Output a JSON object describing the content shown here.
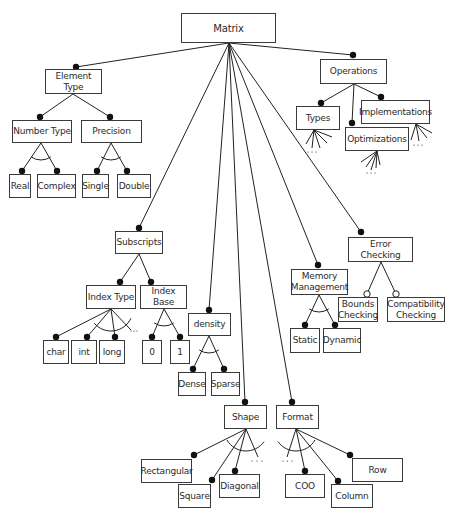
{
  "diagram": {
    "title": "Matrix",
    "colors": {
      "line": "#222222",
      "border": "#3a3a3a",
      "text": "#2b2b2b",
      "dot": "#111111",
      "background": "#ffffff"
    },
    "nodes": [
      {
        "id": "matrix",
        "label": "Matrix",
        "x": 181,
        "y": 13,
        "w": 95,
        "h": 30,
        "root": true
      },
      {
        "id": "element-type",
        "label": "Element Type",
        "x": 45,
        "y": 69,
        "w": 57,
        "h": 25
      },
      {
        "id": "number-type",
        "label": "Number Type",
        "x": 12,
        "y": 120,
        "w": 60,
        "h": 23
      },
      {
        "id": "precision",
        "label": "Precision",
        "x": 81,
        "y": 120,
        "w": 61,
        "h": 23
      },
      {
        "id": "real",
        "label": "Real",
        "x": 9,
        "y": 174,
        "w": 22,
        "h": 24
      },
      {
        "id": "complex",
        "label": "Complex",
        "x": 37,
        "y": 174,
        "w": 39,
        "h": 24
      },
      {
        "id": "single",
        "label": "Single",
        "x": 82,
        "y": 174,
        "w": 27,
        "h": 24
      },
      {
        "id": "double",
        "label": "Double",
        "x": 117,
        "y": 174,
        "w": 34,
        "h": 24
      },
      {
        "id": "operations",
        "label": "Operations",
        "x": 320,
        "y": 59,
        "w": 67,
        "h": 25
      },
      {
        "id": "types",
        "label": "Types",
        "x": 296,
        "y": 106,
        "w": 44,
        "h": 24
      },
      {
        "id": "implementations",
        "label": "Implementations",
        "x": 361,
        "y": 100,
        "w": 69,
        "h": 24
      },
      {
        "id": "optimizations",
        "label": "Optimizations",
        "x": 345,
        "y": 127,
        "w": 64,
        "h": 24
      },
      {
        "id": "subscripts",
        "label": "Subscripts",
        "x": 115,
        "y": 231,
        "w": 48,
        "h": 23
      },
      {
        "id": "index-type",
        "label": "Index Type",
        "x": 86,
        "y": 285,
        "w": 50,
        "h": 24
      },
      {
        "id": "index-base",
        "label": "Index Base",
        "x": 140,
        "y": 285,
        "w": 47,
        "h": 24
      },
      {
        "id": "char",
        "label": "char",
        "x": 43,
        "y": 340,
        "w": 26,
        "h": 24
      },
      {
        "id": "int",
        "label": "int",
        "x": 71,
        "y": 340,
        "w": 26,
        "h": 24
      },
      {
        "id": "long",
        "label": "long",
        "x": 99,
        "y": 340,
        "w": 26,
        "h": 24
      },
      {
        "id": "zero",
        "label": "0",
        "x": 142,
        "y": 340,
        "w": 20,
        "h": 24
      },
      {
        "id": "one",
        "label": "1",
        "x": 170,
        "y": 340,
        "w": 20,
        "h": 24
      },
      {
        "id": "density",
        "label": "density",
        "x": 188,
        "y": 313,
        "w": 43,
        "h": 23
      },
      {
        "id": "dense",
        "label": "Dense",
        "x": 178,
        "y": 372,
        "w": 28,
        "h": 24
      },
      {
        "id": "sparse",
        "label": "Sparse",
        "x": 211,
        "y": 372,
        "w": 29,
        "h": 24
      },
      {
        "id": "memory-management",
        "label": "Memory\nManagement",
        "x": 291,
        "y": 269,
        "w": 57,
        "h": 26
      },
      {
        "id": "static",
        "label": "Static",
        "x": 290,
        "y": 328,
        "w": 30,
        "h": 25
      },
      {
        "id": "dynamic",
        "label": "Dynamic",
        "x": 323,
        "y": 328,
        "w": 38,
        "h": 25
      },
      {
        "id": "error-checking",
        "label": "Error Checking",
        "x": 348,
        "y": 237,
        "w": 65,
        "h": 25
      },
      {
        "id": "bounds-checking",
        "label": "Bounds\nChecking",
        "x": 338,
        "y": 297,
        "w": 40,
        "h": 25
      },
      {
        "id": "compatibility-checking",
        "label": "Compatibility\nChecking",
        "x": 387,
        "y": 297,
        "w": 58,
        "h": 25
      },
      {
        "id": "shape",
        "label": "Shape",
        "x": 224,
        "y": 405,
        "w": 43,
        "h": 24
      },
      {
        "id": "rectangular",
        "label": "Rectangular",
        "x": 141,
        "y": 459,
        "w": 51,
        "h": 24
      },
      {
        "id": "square",
        "label": "Square",
        "x": 178,
        "y": 484,
        "w": 33,
        "h": 24
      },
      {
        "id": "diagonal",
        "label": "Diagonal",
        "x": 219,
        "y": 474,
        "w": 41,
        "h": 24
      },
      {
        "id": "format",
        "label": "Format",
        "x": 276,
        "y": 405,
        "w": 43,
        "h": 24
      },
      {
        "id": "coo",
        "label": "COO",
        "x": 285,
        "y": 474,
        "w": 40,
        "h": 24
      },
      {
        "id": "column",
        "label": "Column",
        "x": 331,
        "y": 484,
        "w": 42,
        "h": 24
      },
      {
        "id": "row",
        "label": "Row",
        "x": 352,
        "y": 458,
        "w": 51,
        "h": 24
      }
    ],
    "edges": [
      {
        "from": [
          229,
          43
        ],
        "to": [
          76,
          67
        ],
        "end": "filled"
      },
      {
        "from": [
          229,
          43
        ],
        "to": [
          353,
          55
        ],
        "end": "filled"
      },
      {
        "from": [
          229,
          43
        ],
        "to": [
          139,
          228
        ],
        "end": "filled"
      },
      {
        "from": [
          229,
          43
        ],
        "to": [
          209,
          310
        ],
        "end": "filled"
      },
      {
        "from": [
          229,
          43
        ],
        "to": [
          245,
          402
        ],
        "end": "filled"
      },
      {
        "from": [
          229,
          43
        ],
        "to": [
          292,
          402
        ],
        "end": "filled"
      },
      {
        "from": [
          229,
          43
        ],
        "to": [
          318,
          265
        ],
        "end": "filled"
      },
      {
        "from": [
          229,
          43
        ],
        "to": [
          361,
          232
        ],
        "end": "filled"
      },
      {
        "from": [
          73,
          94
        ],
        "to": [
          40,
          117
        ],
        "end": "filled"
      },
      {
        "from": [
          73,
          94
        ],
        "to": [
          110,
          117
        ],
        "end": "filled"
      },
      {
        "from": [
          41,
          143
        ],
        "to": [
          22,
          171
        ],
        "end": "filled"
      },
      {
        "from": [
          41,
          143
        ],
        "to": [
          57,
          171
        ],
        "end": "filled"
      },
      {
        "from": [
          111,
          143
        ],
        "to": [
          97,
          171
        ],
        "end": "filled"
      },
      {
        "from": [
          111,
          143
        ],
        "to": [
          127,
          171
        ],
        "end": "filled"
      },
      {
        "from": [
          354,
          84
        ],
        "to": [
          321,
          103
        ],
        "end": "filled"
      },
      {
        "from": [
          354,
          84
        ],
        "to": [
          352,
          123
        ],
        "end": "filled"
      },
      {
        "from": [
          354,
          84
        ],
        "to": [
          381,
          97
        ],
        "end": "filled"
      },
      {
        "from": [
          139,
          254
        ],
        "to": [
          120,
          282
        ],
        "end": "filled"
      },
      {
        "from": [
          139,
          254
        ],
        "to": [
          151,
          282
        ],
        "end": "filled"
      },
      {
        "from": [
          111,
          309
        ],
        "to": [
          56,
          337
        ],
        "end": "filled"
      },
      {
        "from": [
          111,
          309
        ],
        "to": [
          87,
          337
        ],
        "end": "filled"
      },
      {
        "from": [
          111,
          309
        ],
        "to": [
          115,
          337
        ],
        "end": "filled"
      },
      {
        "from": [
          111,
          309
        ],
        "to": [
          131,
          330
        ],
        "end": "none"
      },
      {
        "from": [
          164,
          309
        ],
        "to": [
          152,
          337
        ],
        "end": "filled"
      },
      {
        "from": [
          164,
          309
        ],
        "to": [
          180,
          337
        ],
        "end": "filled"
      },
      {
        "from": [
          209,
          336
        ],
        "to": [
          193,
          369
        ],
        "end": "filled"
      },
      {
        "from": [
          209,
          336
        ],
        "to": [
          224,
          369
        ],
        "end": "filled"
      },
      {
        "from": [
          319,
          295
        ],
        "to": [
          305,
          325
        ],
        "end": "filled"
      },
      {
        "from": [
          319,
          295
        ],
        "to": [
          335,
          325
        ],
        "end": "filled"
      },
      {
        "from": [
          381,
          262
        ],
        "to": [
          367,
          294
        ],
        "end": "hollow"
      },
      {
        "from": [
          381,
          262
        ],
        "to": [
          396,
          294
        ],
        "end": "hollow"
      },
      {
        "from": [
          246,
          429
        ],
        "to": [
          194,
          455
        ],
        "end": "filled"
      },
      {
        "from": [
          246,
          429
        ],
        "to": [
          212,
          480
        ],
        "end": "filled"
      },
      {
        "from": [
          246,
          429
        ],
        "to": [
          235,
          471
        ],
        "end": "filled"
      },
      {
        "from": [
          246,
          429
        ],
        "to": [
          258,
          457
        ],
        "end": "none"
      },
      {
        "from": [
          296,
          429
        ],
        "to": [
          287,
          457
        ],
        "end": "none"
      },
      {
        "from": [
          296,
          429
        ],
        "to": [
          305,
          471
        ],
        "end": "filled"
      },
      {
        "from": [
          296,
          429
        ],
        "to": [
          338,
          481
        ],
        "end": "filled"
      },
      {
        "from": [
          296,
          429
        ],
        "to": [
          350,
          455
        ],
        "end": "filled"
      }
    ],
    "fans": [
      {
        "apex": [
          314,
          130
        ],
        "ends": [
          [
            306,
            144
          ],
          [
            312,
            148
          ],
          [
            320,
            148
          ],
          [
            327,
            143
          ],
          [
            332,
            137
          ]
        ],
        "dots": [
          312,
          152
        ]
      },
      {
        "apex": [
          377,
          151
        ],
        "ends": [
          [
            361,
            162
          ],
          [
            366,
            167
          ],
          [
            371,
            170
          ],
          [
            376,
            168
          ],
          [
            380,
            165
          ]
        ],
        "dots": [
          371,
          173
        ]
      },
      {
        "apex": [
          416,
          124
        ],
        "ends": [
          [
            411,
            140
          ],
          [
            419,
            141
          ],
          [
            427,
            138
          ],
          [
            432,
            133
          ]
        ],
        "dots": [
          418,
          145
        ]
      }
    ],
    "arcs": [
      {
        "cx": 41,
        "cy": 143,
        "r": 17,
        "a1": 55,
        "a2": 125
      },
      {
        "cx": 111,
        "cy": 143,
        "r": 17,
        "a1": 55,
        "a2": 125
      },
      {
        "cx": 111,
        "cy": 309,
        "r": 22,
        "a1": 25,
        "a2": 140
      },
      {
        "cx": 164,
        "cy": 309,
        "r": 17,
        "a1": 55,
        "a2": 125
      },
      {
        "cx": 209,
        "cy": 336,
        "r": 17,
        "a1": 55,
        "a2": 125
      },
      {
        "cx": 319,
        "cy": 295,
        "r": 17,
        "a1": 55,
        "a2": 125
      },
      {
        "cx": 246,
        "cy": 429,
        "r": 22,
        "a1": 35,
        "a2": 150
      },
      {
        "cx": 296,
        "cy": 429,
        "r": 22,
        "a1": 30,
        "a2": 145
      }
    ],
    "ellipses": [
      {
        "x": [
          131,
          137
        ],
        "y": 331
      },
      {
        "x": [
          252,
          262
        ],
        "y": 461
      },
      {
        "x": [
          283,
          292
        ],
        "y": 461
      }
    ],
    "ellipsis_text": "· · ·"
  }
}
